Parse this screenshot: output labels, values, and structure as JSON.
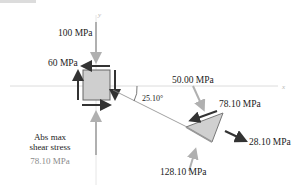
{
  "diagram": {
    "type": "stress-transformation",
    "axes": {
      "x_label": "x",
      "y_label": "y"
    },
    "element": {
      "normal_stress_y": "100 MPa",
      "shear_stress": "60 MPa"
    },
    "rotated_plane": {
      "angle": "25.10°",
      "normal_stress": "50.00 MPa",
      "shear_stress": "78.10 MPa",
      "principal_tension": "28.10 MPa",
      "principal_compression": "128.10 MPa"
    },
    "summary": {
      "title_line1": "Abs max",
      "title_line2": "shear stress",
      "value": "78.10 MPa"
    },
    "colors": {
      "element_fill": "#cfcfcf",
      "element_border": "#555555",
      "dark_arrow": "#333333",
      "light_arrow": "#b3b3b3",
      "axis_line": "#d0d0d0"
    }
  }
}
